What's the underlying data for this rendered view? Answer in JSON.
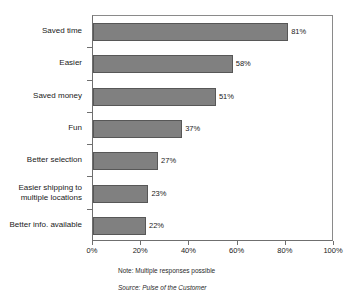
{
  "chart_data": {
    "type": "bar",
    "orientation": "horizontal",
    "title": "",
    "subtitle": "",
    "xlabel": "",
    "ylabel": "",
    "categories": [
      "Saved time",
      "Easier",
      "Saved money",
      "Fun",
      "Better selection",
      "Easier shipping to\nmultiple locations",
      "Better info. available"
    ],
    "values": [
      81,
      58,
      51,
      37,
      27,
      23,
      22
    ],
    "value_labels": [
      "81%",
      "58%",
      "51%",
      "37%",
      "27%",
      "23%",
      "22%"
    ],
    "xlim": [
      0,
      100
    ],
    "xticks": [
      0,
      20,
      40,
      60,
      80,
      100
    ],
    "xtick_labels": [
      "0%",
      "20%",
      "40%",
      "60%",
      "80%",
      "100%"
    ],
    "grid": false,
    "legend": false,
    "legend_position": "none",
    "bar_color": "#808080",
    "bar_edge_color": "#575757",
    "axis_color": "#6f6f6f",
    "background_color": "#ffffff"
  },
  "footnotes": {
    "note": "Note: Multiple responses possible",
    "source": "Source: Pulse of the Customer"
  }
}
